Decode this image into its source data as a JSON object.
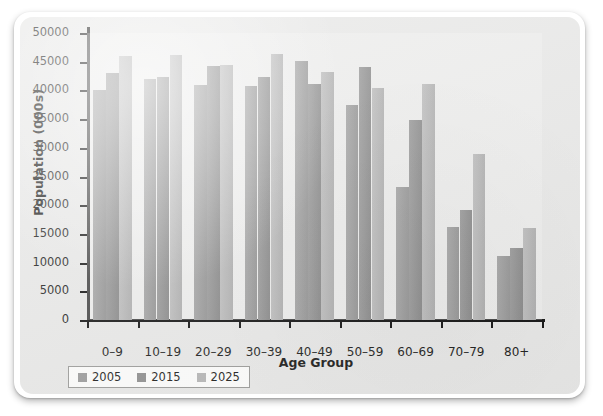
{
  "chart_data": {
    "type": "bar",
    "title": "",
    "xlabel": "Age Group",
    "ylabel": "Population (000s)",
    "categories": [
      "0–9",
      "10–19",
      "20–29",
      "30–39",
      "40–49",
      "50–59",
      "60–69",
      "70–79",
      "80+"
    ],
    "series": [
      {
        "name": "2005",
        "color": "#9a9a9a",
        "values": [
          40000,
          42000,
          41000,
          40700,
          45200,
          37500,
          23200,
          16200,
          11200
        ]
      },
      {
        "name": "2015",
        "color": "#8e8e8e",
        "values": [
          43100,
          42300,
          44200,
          42300,
          41100,
          44000,
          34800,
          19200,
          12500
        ]
      },
      {
        "name": "2025",
        "color": "#b5b5b5",
        "values": [
          46000,
          46100,
          44500,
          46400,
          43200,
          40400,
          41200,
          29000,
          16000
        ]
      }
    ],
    "ylim": [
      0,
      50000
    ],
    "yticks": [
      0,
      5000,
      10000,
      15000,
      20000,
      25000,
      30000,
      35000,
      40000,
      45000,
      50000
    ],
    "ytick_labels": [
      "0",
      "5000",
      "10000",
      "15000",
      "20000",
      "25000",
      "30000",
      "35000",
      "40000",
      "45000",
      "50000"
    ],
    "grid": false,
    "legend_position": "bottom-left",
    "axis_color": "#111111",
    "text_color": "#1d1d1b",
    "panel_background": "#e7e7e6"
  }
}
